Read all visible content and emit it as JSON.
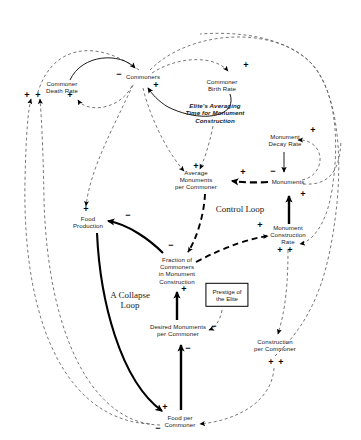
{
  "diagram": {
    "type": "causal-loop-diagram",
    "canvas": {
      "width": 361,
      "height": 440,
      "background": "#ffffff"
    },
    "colors": {
      "solid_link": "#000000",
      "dashed_link": "#555555",
      "text": "#1a1a1a",
      "box_border": "#000000"
    },
    "variables": [
      {
        "id": "commoner-death-rate",
        "label": "Commoner\nDeath Rate",
        "x": 62,
        "y": 87,
        "style": "plain"
      },
      {
        "id": "commoners",
        "label": "Commoners",
        "x": 143,
        "y": 77,
        "style": "plain"
      },
      {
        "id": "commoner-birth-rate",
        "label": "Commoner\nBirth Rate",
        "x": 222,
        "y": 85,
        "style": "plain"
      },
      {
        "id": "elites-averaging-time",
        "label": "Elite's Averaging\nTime for Monument\nConstruction",
        "x": 215,
        "y": 113,
        "style": "bold-italic"
      },
      {
        "id": "monument-decay-rate",
        "label": "Monument\nDecay Rate",
        "x": 285,
        "y": 140,
        "style": "plain"
      },
      {
        "id": "average-monuments-per-commoner",
        "label": "Average\nMonuments\nper Commoner",
        "x": 196,
        "y": 180,
        "style": "plain"
      },
      {
        "id": "monuments",
        "label": "Monuments",
        "x": 288,
        "y": 182,
        "style": "plain"
      },
      {
        "id": "food-production",
        "label": "Food\nProduction",
        "x": 88,
        "y": 222,
        "style": "plain"
      },
      {
        "id": "monument-construction-rate",
        "label": "Monument\nConstruction\nRate",
        "x": 288,
        "y": 235,
        "style": "plain"
      },
      {
        "id": "fraction-of-commoners",
        "label": "Fraction of\nCommoners\nin Monument\nConstruction",
        "x": 177,
        "y": 270,
        "style": "plain"
      },
      {
        "id": "prestige-of-the-elite",
        "label": "Prestige of\nthe Elite",
        "x": 227,
        "y": 295,
        "style": "boxed"
      },
      {
        "id": "desired-monuments-per-commoner",
        "label": "Desired Monuments\nper Commoner",
        "x": 178,
        "y": 330,
        "style": "plain"
      },
      {
        "id": "construction-per-commoner",
        "label": "Construction\nper Commoner",
        "x": 275,
        "y": 345,
        "style": "plain"
      },
      {
        "id": "food-per-commoner",
        "label": "Food per\nCommoner",
        "x": 180,
        "y": 421,
        "style": "plain"
      }
    ],
    "loop_labels": [
      {
        "id": "control-loop",
        "label": "Control Loop",
        "x": 240,
        "y": 209
      },
      {
        "id": "collapse-loop",
        "label": "A Collapse\nLoop",
        "x": 130,
        "y": 300
      }
    ],
    "polarities": [
      {
        "id": "p1",
        "sign": "+",
        "x": 27,
        "y": 95
      },
      {
        "id": "p2",
        "sign": "+",
        "x": 38,
        "y": 95
      },
      {
        "id": "p3",
        "sign": "+",
        "x": 70,
        "y": 95
      },
      {
        "id": "p4",
        "sign": "−",
        "x": 119,
        "y": 74
      },
      {
        "id": "p5",
        "sign": "+",
        "x": 156,
        "y": 85
      },
      {
        "id": "p6",
        "sign": "+",
        "x": 246,
        "y": 65
      },
      {
        "id": "p7",
        "sign": "+",
        "x": 313,
        "y": 130
      },
      {
        "id": "p8",
        "sign": "+",
        "x": 196,
        "y": 166
      },
      {
        "id": "p9",
        "sign": "+",
        "x": 243,
        "y": 172
      },
      {
        "id": "p10",
        "sign": "−",
        "x": 273,
        "y": 171
      },
      {
        "id": "p11",
        "sign": "+",
        "x": 303,
        "y": 194
      },
      {
        "id": "p12",
        "sign": "+",
        "x": 86,
        "y": 209
      },
      {
        "id": "p13",
        "sign": "−",
        "x": 128,
        "y": 215
      },
      {
        "id": "p14",
        "sign": "+",
        "x": 260,
        "y": 225
      },
      {
        "id": "p15",
        "sign": "−",
        "x": 171,
        "y": 245
      },
      {
        "id": "p16",
        "sign": "+",
        "x": 280,
        "y": 250
      },
      {
        "id": "p17",
        "sign": "+",
        "x": 290,
        "y": 250
      },
      {
        "id": "p18",
        "sign": "+",
        "x": 184,
        "y": 289
      },
      {
        "id": "p19",
        "sign": "−",
        "x": 214,
        "y": 326
      },
      {
        "id": "p20",
        "sign": "−",
        "x": 188,
        "y": 348
      },
      {
        "id": "p21",
        "sign": "+",
        "x": 271,
        "y": 362
      },
      {
        "id": "p22",
        "sign": "+",
        "x": 281,
        "y": 362
      },
      {
        "id": "p23",
        "sign": "+",
        "x": 165,
        "y": 407
      },
      {
        "id": "p24",
        "sign": "−",
        "x": 158,
        "y": 428
      }
    ]
  }
}
